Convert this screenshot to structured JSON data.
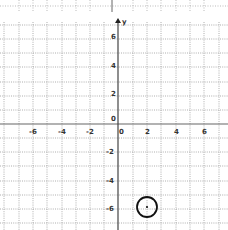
{
  "graph": {
    "axis_labels": {
      "x": "",
      "y": "y"
    },
    "x_tick_labels": [
      "-6",
      "-4",
      "-2",
      "0",
      "2",
      "4",
      "6"
    ],
    "y_tick_labels": [
      "6",
      "4",
      "2",
      "0",
      "-2",
      "-4",
      "-6"
    ],
    "origin_label": "0",
    "x_range": [
      -8,
      7
    ],
    "y_range": [
      -7,
      7
    ],
    "grid": true,
    "grid_style": "dotted",
    "colors": {
      "grid": "#9a9a9a",
      "axis": "#555555",
      "shape": "#111111"
    }
  },
  "shapes": [
    {
      "type": "circle",
      "center": [
        2,
        -6
      ],
      "radius": 0.75,
      "label": ""
    }
  ]
}
